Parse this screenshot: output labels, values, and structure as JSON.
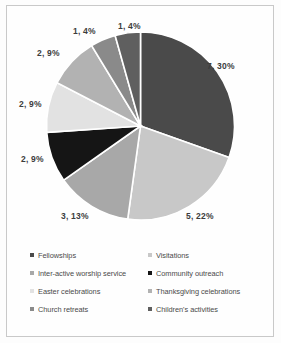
{
  "chart_data": {
    "type": "pie",
    "title": "",
    "subtitle": "",
    "xlabel": "",
    "ylabel": "",
    "legend_position": "bottom",
    "grid": false,
    "categories": [
      "Fellowships",
      "Visitations",
      "Inter-active worship service",
      "Community outreach",
      "Easter celebrations",
      "Thanksgiving celebrations",
      "Church retreats",
      "Children's activities"
    ],
    "values": [
      7,
      5,
      3,
      2,
      2,
      2,
      1,
      1
    ],
    "percents": [
      30,
      22,
      13,
      9,
      9,
      9,
      4,
      4
    ],
    "colors": [
      "#4a4a4a",
      "#c8c8c8",
      "#a8a8a8",
      "#151515",
      "#e2e2e2",
      "#b2b2b2",
      "#8a8a8a",
      "#5f5f5f"
    ],
    "data_labels": [
      "7, 30%",
      "5, 22%",
      "3, 13%",
      "2, 9%",
      "2, 9%",
      "2, 9%",
      "1, 4%",
      "1, 4%"
    ]
  },
  "labels": {
    "slice_0": "7, 30%",
    "slice_1": "5, 22%",
    "slice_2": "3, 13%",
    "slice_3": "2, 9%",
    "slice_4": "2, 9%",
    "slice_5": "2, 9%",
    "slice_6": "1, 4%",
    "slice_7": "1, 4%"
  },
  "legend": {
    "rows": [
      [
        {
          "label": "Fellowships",
          "color": "#4a4a4a"
        },
        {
          "label": "Visitations",
          "color": "#c8c8c8"
        }
      ],
      [
        {
          "label": "Inter-active worship service",
          "color": "#a8a8a8"
        },
        {
          "label": "Community outreach",
          "color": "#151515"
        }
      ],
      [
        {
          "label": "Easter celebrations",
          "color": "#e2e2e2"
        },
        {
          "label": "Thanksgiving celebrations",
          "color": "#b2b2b2"
        }
      ],
      [
        {
          "label": "Church retreats",
          "color": "#8a8a8a"
        },
        {
          "label": "Children's activities",
          "color": "#5f5f5f"
        }
      ]
    ]
  }
}
